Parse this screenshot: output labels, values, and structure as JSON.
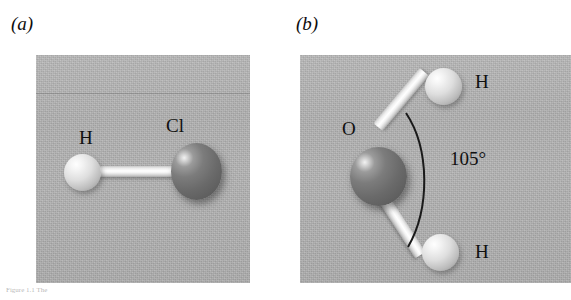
{
  "figure": {
    "caption_remnant": "Figure 1.1  The",
    "panels": [
      {
        "label": "(a)",
        "molecule": "hydrogen chloride",
        "atoms": [
          {
            "symbol": "H",
            "kind": "light"
          },
          {
            "symbol": "Cl",
            "kind": "dark"
          }
        ],
        "bonds": 1,
        "angle_label": null
      },
      {
        "label": "(b)",
        "molecule": "water",
        "atoms": [
          {
            "symbol": "O",
            "kind": "dark"
          },
          {
            "symbol": "H",
            "kind": "light"
          },
          {
            "symbol": "H",
            "kind": "light"
          }
        ],
        "bonds": 2,
        "angle_label": "105°"
      }
    ]
  },
  "colors": {
    "panel_background": "#b4b4b4",
    "page_background": "#ffffff",
    "text": "#101010",
    "bond_highlight": "#ffffff",
    "atom_light": "#dedede",
    "atom_dark": "#6a6a6a",
    "arc_stroke": "#1a1a1a"
  }
}
